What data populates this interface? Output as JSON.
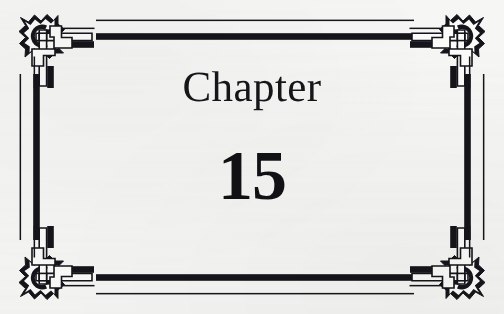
{
  "page": {
    "kind": "book-chapter-opening-page",
    "background_color": "#f6f6f4",
    "ink_color": "#111115"
  },
  "title": {
    "chapter_label": "Chapter",
    "chapter_number": "15"
  },
  "frame": {
    "style_name": "celtic-interlace-border",
    "rule_color": "#101014",
    "corner_ornaments": [
      {
        "name": "corner-ornament-top-left",
        "position": "top-left",
        "icon": "celtic-knot-icon"
      },
      {
        "name": "corner-ornament-top-right",
        "position": "top-right",
        "icon": "celtic-knot-icon"
      },
      {
        "name": "corner-ornament-bottom-left",
        "position": "bottom-left",
        "icon": "celtic-knot-icon"
      },
      {
        "name": "corner-ornament-bottom-right",
        "position": "bottom-right",
        "icon": "celtic-knot-icon"
      }
    ],
    "edges": [
      {
        "name": "border-rule-top",
        "position": "top",
        "pattern": "thin-rule-over-thick-band"
      },
      {
        "name": "border-rule-right",
        "position": "right",
        "pattern": "thick-band-then-thin-rule"
      },
      {
        "name": "border-rule-bottom",
        "position": "bottom",
        "pattern": "thick-band-over-thin-rule"
      },
      {
        "name": "border-rule-left",
        "position": "left",
        "pattern": "thin-rule-then-thick-band"
      }
    ]
  }
}
